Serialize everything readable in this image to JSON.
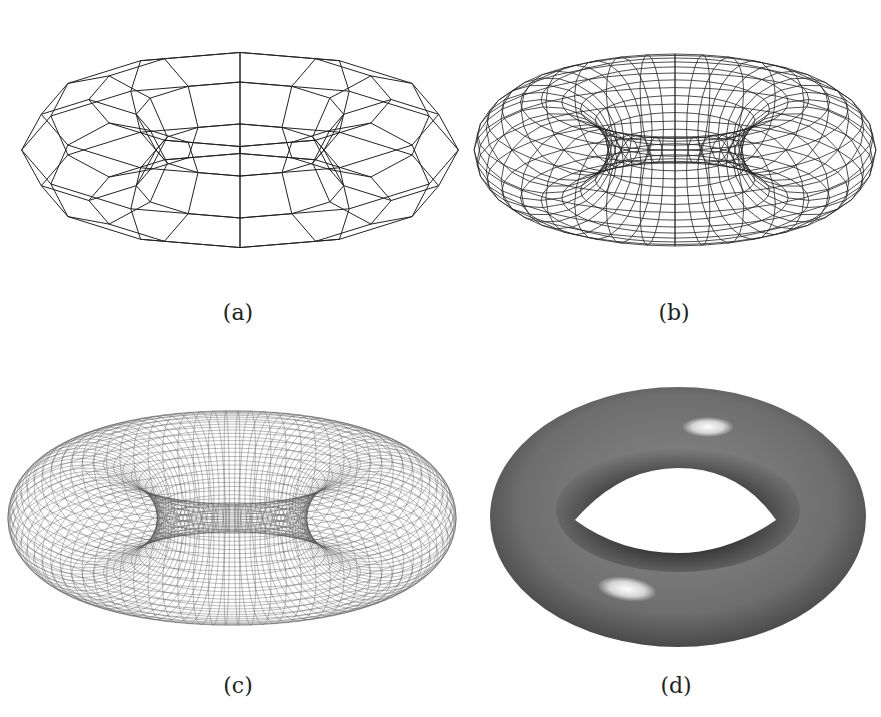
{
  "figure": {
    "panels": [
      {
        "id": "a",
        "caption": "(a)",
        "description": "coarse wireframe torus (12 x 8 facets)"
      },
      {
        "id": "b",
        "caption": "(b)",
        "description": "medium-resolution wireframe torus"
      },
      {
        "id": "c",
        "caption": "(c)",
        "description": "fine-resolution wireframe torus"
      },
      {
        "id": "d",
        "caption": "(d)",
        "description": "smooth shaded torus with specular highlights"
      }
    ],
    "colors": {
      "line": "#222222",
      "shade_dark": "#3a3a3a",
      "shade_mid": "#7a7a7a",
      "highlight": "#ffffff",
      "background": "#ffffff"
    }
  }
}
